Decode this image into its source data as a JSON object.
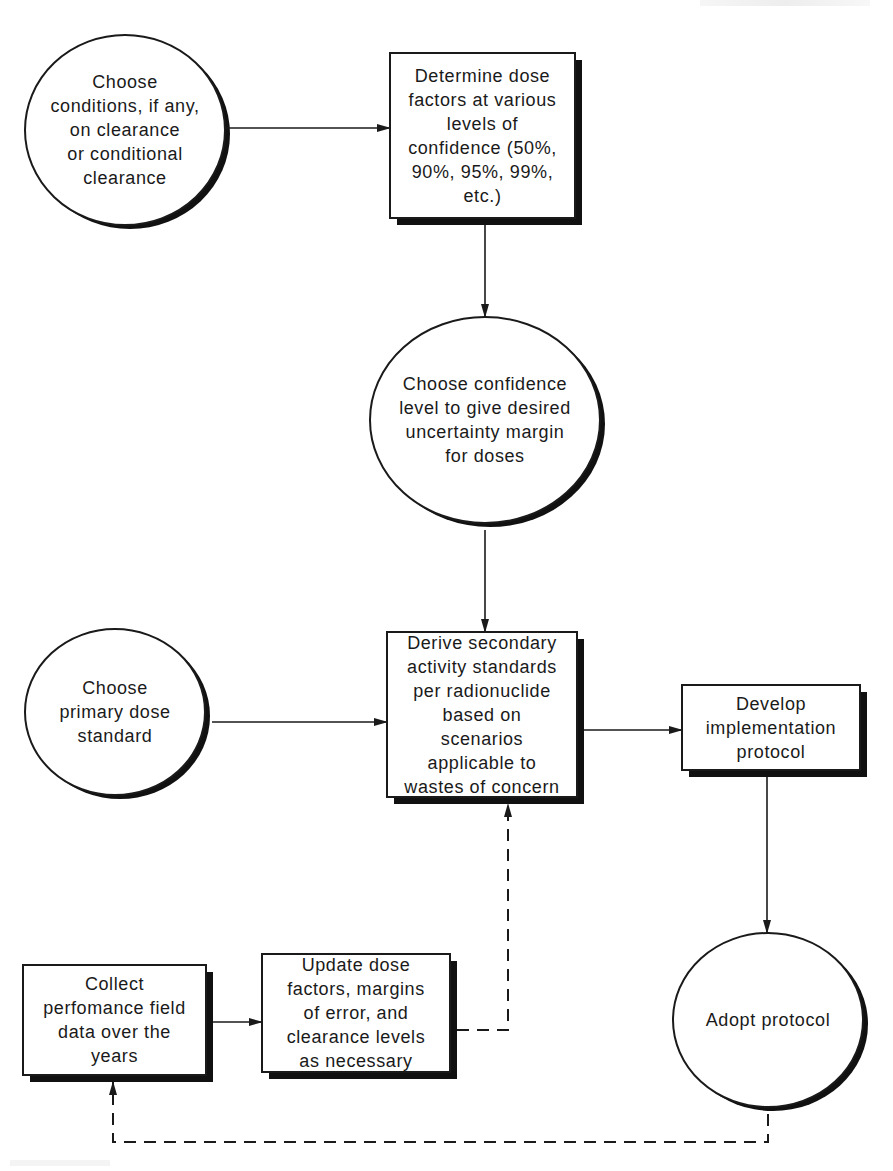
{
  "diagram": {
    "type": "flowchart",
    "colors": {
      "stroke": "#1a1a1a",
      "shadow": "#111111",
      "fill": "#ffffff",
      "text": "#1a1a1a"
    },
    "nodes": [
      {
        "id": "choose-conditions",
        "shape": "ellipse",
        "label": "Choose\nconditions, if any,\non clearance\nor conditional\nclearance"
      },
      {
        "id": "determine-dose-factors",
        "shape": "box",
        "label": "Determine dose\nfactors at various\nlevels of\nconfidence (50%,\n90%, 95%, 99%,\netc.)"
      },
      {
        "id": "choose-confidence-level",
        "shape": "ellipse",
        "label": "Choose confidence\nlevel to give desired\nuncertainty margin\nfor doses"
      },
      {
        "id": "choose-primary-dose-standard",
        "shape": "ellipse",
        "label": "Choose\nprimary dose\nstandard"
      },
      {
        "id": "derive-secondary-standards",
        "shape": "box",
        "label": "Derive secondary\nactivity standards\nper radionuclide\nbased on\nscenarios\napplicable to\nwastes of concern"
      },
      {
        "id": "develop-implementation-protocol",
        "shape": "box",
        "label": "Develop\nimplementation\nprotocol"
      },
      {
        "id": "collect-field-data",
        "shape": "box",
        "label": "Collect\nperfomance field\ndata over the\nyears"
      },
      {
        "id": "update-dose-factors",
        "shape": "box",
        "label": "Update dose\nfactors, margins\nof error, and\nclearance levels\nas necessary"
      },
      {
        "id": "adopt-protocol",
        "shape": "ellipse",
        "label": "Adopt protocol"
      }
    ],
    "edges": [
      {
        "from": "choose-conditions",
        "to": "determine-dose-factors",
        "style": "solid"
      },
      {
        "from": "determine-dose-factors",
        "to": "choose-confidence-level",
        "style": "solid"
      },
      {
        "from": "choose-confidence-level",
        "to": "derive-secondary-standards",
        "style": "solid"
      },
      {
        "from": "choose-primary-dose-standard",
        "to": "derive-secondary-standards",
        "style": "solid"
      },
      {
        "from": "derive-secondary-standards",
        "to": "develop-implementation-protocol",
        "style": "solid"
      },
      {
        "from": "develop-implementation-protocol",
        "to": "adopt-protocol",
        "style": "solid"
      },
      {
        "from": "collect-field-data",
        "to": "update-dose-factors",
        "style": "solid"
      },
      {
        "from": "update-dose-factors",
        "to": "derive-secondary-standards",
        "style": "dashed"
      },
      {
        "from": "adopt-protocol",
        "to": "collect-field-data",
        "style": "dashed"
      }
    ]
  }
}
